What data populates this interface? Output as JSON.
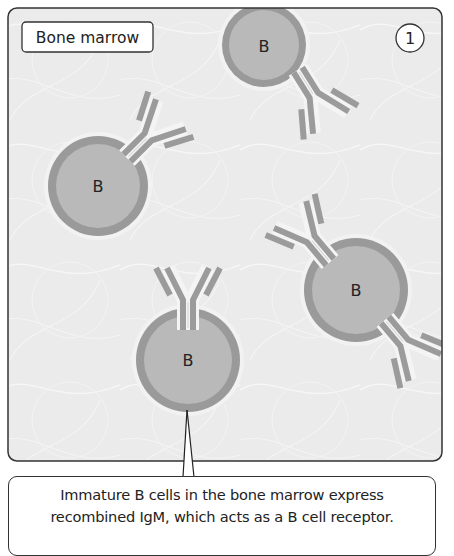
{
  "panel": {
    "location_label": "Bone marrow",
    "step_number": "1",
    "cell_label": "B",
    "cells": [
      {
        "id": "top",
        "label": "B"
      },
      {
        "id": "left",
        "label": "B"
      },
      {
        "id": "right",
        "label": "B"
      },
      {
        "id": "bottom",
        "label": "B"
      }
    ]
  },
  "caption": {
    "line1": "Immature B cells in the bone marrow express",
    "line2": "recombined IgM, which acts as a B cell receptor."
  },
  "colors": {
    "frame_bg": "#ebebeb",
    "frame_border": "#333333",
    "cell_fill": "#b9b9b9",
    "cell_membrane": "#9a9a9a",
    "antibody": "#9b9b9b",
    "text": "#222222"
  }
}
